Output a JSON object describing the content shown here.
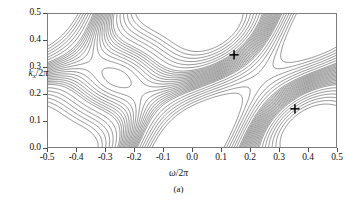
{
  "figure": {
    "caption": "(a)",
    "marker_symbol": "+",
    "frame_color": "#7c7c7c",
    "contour_color": "#3a3a3a"
  },
  "axes": {
    "x": {
      "label_omega": "ω",
      "label_div": "/2",
      "label_pi": "π",
      "label_full": "ω/2π",
      "min": -0.5,
      "max": 0.5,
      "ticks": [
        -0.5,
        -0.4,
        -0.3,
        -0.2,
        -0.1,
        0.0,
        0.1,
        0.2,
        0.3,
        0.4,
        0.5
      ],
      "tick_labels": [
        "-0.5",
        "-0.4",
        "-0.3",
        "-0.2",
        "-0.1",
        "0.0",
        "0.1",
        "0.2",
        "0.3",
        "0.4",
        "0.5"
      ]
    },
    "y": {
      "label_k": "k",
      "label_sub": "x",
      "label_div": "/2",
      "label_pi": "π",
      "label_full": "k_x/2π",
      "min": 0.0,
      "max": 0.5,
      "ticks": [
        0.0,
        0.1,
        0.2,
        0.3,
        0.4,
        0.5
      ],
      "tick_labels": [
        "0.0",
        "0.1",
        "0.2",
        "0.3",
        "0.4",
        "0.5"
      ]
    }
  },
  "chart_data": {
    "type": "contour",
    "title": "",
    "xlabel": "ω/2π",
    "ylabel": "k_x/2π",
    "xlim": [
      -0.5,
      0.5
    ],
    "ylim": [
      0.0,
      0.5
    ],
    "grid": false,
    "legend": false,
    "markers": [
      {
        "symbol": "+",
        "x": 0.145,
        "y": 0.345
      },
      {
        "symbol": "+",
        "x": 0.355,
        "y": 0.145
      }
    ],
    "contour_levels": [
      -1.0,
      -0.9,
      -0.8,
      -0.7,
      -0.6,
      -0.5,
      -0.4,
      -0.35,
      -0.3,
      -0.25,
      -0.2,
      -0.15,
      -0.1,
      -0.05,
      0.0,
      0.05,
      0.1,
      0.15,
      0.2,
      0.25,
      0.3,
      0.35,
      0.4,
      0.5,
      0.6,
      0.7,
      0.8,
      0.9,
      1.0
    ],
    "extrema": [
      {
        "kind": "maximum",
        "x": 0.02,
        "y": 0.42
      },
      {
        "kind": "maximum",
        "x": 0.45,
        "y": 0.35
      },
      {
        "kind": "minimum",
        "x": -0.45,
        "y": 0.15
      },
      {
        "kind": "minimum",
        "x": 0.03,
        "y": 0.03
      }
    ]
  }
}
